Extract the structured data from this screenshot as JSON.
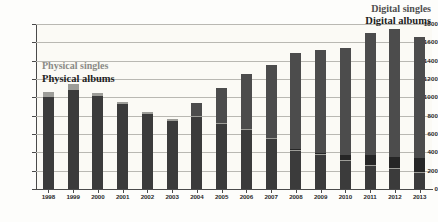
{
  "chart_data": {
    "type": "bar",
    "stacked": true,
    "title": "",
    "subtitle": "",
    "xlabel": "",
    "ylabel": "",
    "ylim": [
      0,
      1800
    ],
    "ytick_values": [
      0,
      200,
      400,
      600,
      800,
      1000,
      1200,
      1400,
      1600,
      1800
    ],
    "ytick_labels": [
      "0",
      "200",
      "400",
      "600",
      "800",
      "1000",
      "1200",
      "1400",
      "1600",
      "1800"
    ],
    "grid": true,
    "grid_axis": "y",
    "legend_position": "inside",
    "categories": [
      "1998",
      "1999",
      "2000",
      "2001",
      "2002",
      "2003",
      "2004",
      "2005",
      "2006",
      "2007",
      "2008",
      "2009",
      "2010",
      "2011",
      "2012",
      "2013"
    ],
    "series": [
      {
        "name": "Physical albums",
        "color": "#3b3b3b",
        "values": [
          1000,
          1080,
          1010,
          930,
          820,
          745,
          785,
          710,
          645,
          545,
          420,
          375,
          305,
          255,
          215,
          180
        ]
      },
      {
        "name": "Physical singles",
        "color": "#9d9d98",
        "values": [
          55,
          70,
          40,
          20,
          20,
          15,
          10,
          10,
          10,
          10,
          10,
          10,
          10,
          10,
          10,
          10
        ]
      },
      {
        "name": "Digital albums",
        "color": "#262626",
        "values": [
          0,
          0,
          0,
          0,
          0,
          0,
          0,
          0,
          0,
          0,
          10,
          10,
          55,
          110,
          125,
          150
        ]
      },
      {
        "name": "Digital singles",
        "color": "#4c4c4c",
        "values": [
          0,
          0,
          0,
          0,
          0,
          0,
          145,
          380,
          600,
          800,
          1045,
          1120,
          1170,
          1325,
          1400,
          1315
        ]
      }
    ],
    "totals": [
      1055,
      1150,
      1050,
      950,
      840,
      760,
      940,
      1100,
      1255,
      1355,
      1485,
      1515,
      1540,
      1700,
      1750,
      1655
    ]
  },
  "legend": {
    "digital_singles": "Digital singles",
    "digital_albums": "Digital albums",
    "physical_singles": "Physical singles",
    "physical_albums": "Physical albums"
  },
  "colors": {
    "physical_albums": "#3b3b3b",
    "physical_singles": "#9d9d98",
    "digital_albums": "#262626",
    "digital_singles": "#4c4c4c",
    "axis": "#4a4a4a",
    "grid": "#b9b8b2",
    "background": "#fbfaf5"
  }
}
